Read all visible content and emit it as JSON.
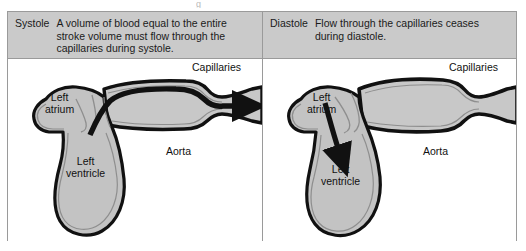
{
  "figure": {
    "top_fragment": "g",
    "panels": [
      {
        "id": "systole",
        "phase_label": "Systole",
        "caption": "A volume of blood equal to the entire stroke volume must flow through the capillaries during systole.",
        "labels": {
          "capillaries": "Capillaries",
          "left_atrium_line1": "Left",
          "left_atrium_line2": "atrium",
          "left_ventricle_line1": "Left",
          "left_ventricle_line2": "ventricle",
          "aorta": "Aorta"
        },
        "flow": {
          "aortic_outflow_arrow": true,
          "mitral_inflow_arrow": false,
          "capillary_flow": true
        }
      },
      {
        "id": "diastole",
        "phase_label": "Diastole",
        "caption": "Flow through the capillaries ceases during diastole.",
        "labels": {
          "capillaries": "Capillaries",
          "left_atrium_line1": "Left",
          "left_atrium_line2": "atrium",
          "left_ventricle_line1": "Left",
          "left_ventricle_line2": "ventricle",
          "aorta": "Aorta"
        },
        "flow": {
          "aortic_outflow_arrow": false,
          "mitral_inflow_arrow": true,
          "capillary_flow": false
        }
      }
    ],
    "colors": {
      "caption_background": "#cacaca",
      "tissue_fill": "#c3c3c3",
      "lumen_fill": "#c9c9c9",
      "outline": "#111111",
      "inner_line": "#8e8e8e",
      "frame_border": "#9a9a9a",
      "page_background": "#ffffff",
      "text": "#111111"
    }
  }
}
